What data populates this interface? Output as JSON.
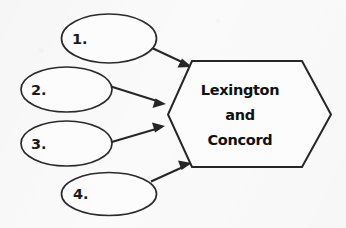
{
  "diagram": {
    "background_color": "#fbfafa",
    "stroke_color": "#262626",
    "center_node": {
      "shape": "hexagon",
      "lines": [
        "Lexington",
        "and",
        "Concord"
      ],
      "line1": "Lexington",
      "line2": "and",
      "line3": "Concord"
    },
    "input_nodes": [
      {
        "id": "node-1",
        "shape": "ellipse",
        "label": "1."
      },
      {
        "id": "node-2",
        "shape": "ellipse",
        "label": "2."
      },
      {
        "id": "node-3",
        "shape": "ellipse",
        "label": "3."
      },
      {
        "id": "node-4",
        "shape": "ellipse",
        "label": "4."
      }
    ],
    "connectors": [
      {
        "id": "arrow-1",
        "from": "node-1",
        "to": "center-node",
        "style": "single-headed-arrow"
      },
      {
        "id": "arrow-2",
        "from": "node-2",
        "to": "center-node",
        "style": "single-headed-arrow"
      },
      {
        "id": "arrow-3",
        "from": "node-3",
        "to": "center-node",
        "style": "single-headed-arrow"
      },
      {
        "id": "arrow-4",
        "from": "node-4",
        "to": "center-node",
        "style": "single-headed-arrow"
      }
    ]
  }
}
